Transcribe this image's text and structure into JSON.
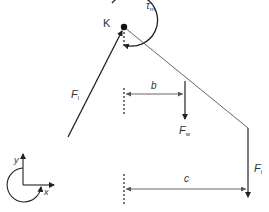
{
  "diagram": {
    "pivot_label": "K",
    "moment": {
      "symbol": "τ",
      "subscript": "m"
    },
    "forces": [
      {
        "id": "F_l_diag",
        "symbol": "F",
        "subscript": "l"
      },
      {
        "id": "F_w",
        "symbol": "F",
        "subscript": "w"
      },
      {
        "id": "F_l_vert",
        "symbol": "F",
        "subscript": "l"
      }
    ],
    "distances": [
      {
        "id": "b",
        "label": "b"
      },
      {
        "id": "c",
        "label": "c"
      }
    ],
    "axes": {
      "x_label": "x",
      "y_label": "y"
    },
    "colors": {
      "line": "#222222",
      "thin_line": "#555555",
      "arrow_grey": "#888888",
      "text": "#333333"
    }
  }
}
